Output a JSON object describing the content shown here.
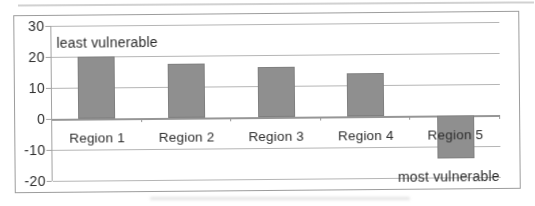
{
  "page": {
    "background": "#ffffff"
  },
  "chart_data": {
    "type": "bar",
    "title": "",
    "xlabel": "",
    "ylabel": "",
    "categories": [
      "Region 1",
      "Region 2",
      "Region 3",
      "Region 4",
      "Region 5"
    ],
    "values": [
      20,
      17.5,
      16,
      14,
      -14
    ],
    "ylim": [
      -20,
      30
    ],
    "yticks": [
      30,
      20,
      10,
      0,
      -10,
      -20
    ],
    "grid": true,
    "legend": false,
    "annotations": {
      "top_left": "least vulnerable",
      "bottom_right": "most vulnerable"
    },
    "colors": {
      "bar": "#8f8f8f",
      "bar_border": "#7f7f7f",
      "gridline": "#b5b5b5",
      "zero_axis": "#969696",
      "y_axis": "#a2a2a2",
      "frame_border": "#9c9c9c",
      "text": "#2d2d2d"
    }
  }
}
